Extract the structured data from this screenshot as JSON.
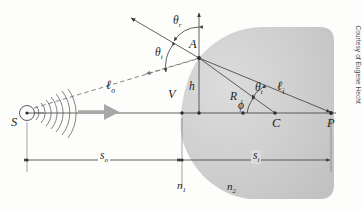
{
  "figure": {
    "credit": "Courtesy of Eugene Hecht",
    "colors": {
      "medium_fill": "#c9c9c9",
      "medium_fill_light": "#d8d8d8",
      "line": "#3a3a3a",
      "wave_arrow": "#a8a8a8",
      "dashed_ray": "#6f6f6f"
    }
  },
  "labels": {
    "source": "S",
    "point_a": "A",
    "vertex": "V",
    "center": "C",
    "image_point": "P",
    "height": "h",
    "radius": "R",
    "theta_r": "θ",
    "theta_r_sub": "r",
    "theta_i": "θ",
    "theta_i_sub": "i",
    "theta_t": "θ",
    "theta_t_sub": "t",
    "phi": "ϕ",
    "ell_o": "ℓ",
    "ell_o_sub": "o",
    "ell_i": "ℓ",
    "ell_i_sub": "i",
    "n1": "n",
    "n1_sub": "1",
    "n2": "n",
    "n2_sub": "2",
    "s_o": "s",
    "s_o_sub": "o",
    "s_i": "s",
    "s_i_sub": "i"
  },
  "geometry": {
    "axis_y": 113,
    "source_x": 27,
    "vertex_x": 182,
    "point_a": [
      199,
      58
    ],
    "center_x": 275,
    "image_x": 331,
    "dim_line_y": 160,
    "object_distance_label": "s_o",
    "image_distance_label": "s_i"
  },
  "elements": {
    "incident_ray_style": "dashed",
    "reflected_ray_style": "solid-arrow",
    "normal_style": "solid-arrow-up",
    "wavefront_count": 7
  }
}
